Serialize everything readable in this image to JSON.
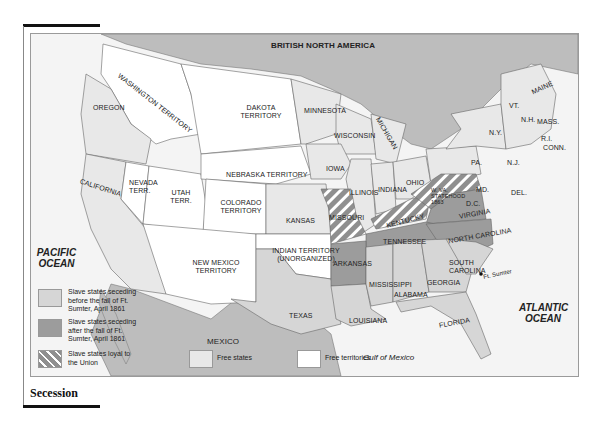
{
  "caption": "Secession",
  "map": {
    "title_region": "BRITISH NORTH AMERICA",
    "oceans": {
      "pacific": "PACIFIC OCEAN",
      "atlantic": "ATLANTIC OCEAN",
      "gulf": "Gulf of Mexico"
    },
    "labels": {
      "washington": "WASHINGTON TERRITORY",
      "oregon": "OREGON",
      "california": "CALIFORNIA",
      "nevada": "NEVADA TERR.",
      "utah": "UTAH TERR.",
      "dakota": "DAKOTA TERRITORY",
      "nebraska": "NEBRASKA TERRITORY",
      "colorado": "COLORADO TERRITORY",
      "kansas": "KANSAS",
      "newmexico": "NEW MEXICO TERRITORY",
      "indian": "INDIAN TERRITORY (UNORGANIZED)",
      "texas": "TEXAS",
      "mexico": "MEXICO",
      "minnesota": "MINNESOTA",
      "wisconsin": "WISCONSIN",
      "michigan": "MICHIGAN",
      "iowa": "IOWA",
      "illinois": "ILLINOIS",
      "indiana": "INDIANA",
      "ohio": "OHIO",
      "missouri": "MISSOURI",
      "kentucky": "KENTUCKY",
      "tennessee": "TENNESSEE",
      "arkansas": "ARKANSAS",
      "louisiana": "LOUISIANA",
      "mississippi": "MISSISSIPPI",
      "alabama": "ALABAMA",
      "georgia": "GEORGIA",
      "florida": "FLORIDA",
      "southcarolina": "SOUTH CAROLINA",
      "northcarolina": "NORTH CAROLINA",
      "virginia": "VIRGINIA",
      "wva": "W. VA. Statehood 1863",
      "dc": "D.C.",
      "md": "MD.",
      "del": "DEL.",
      "pa": "PA.",
      "nj": "N.J.",
      "ny": "N.Y.",
      "vt": "VT.",
      "nh": "N.H.",
      "maine": "MAINE",
      "mass": "MASS.",
      "ri": "R.I.",
      "conn": "CONN.",
      "ftsumter": "Ft. Sumter"
    },
    "legend": [
      {
        "key": "seceding_before",
        "text": "Slave states seceding before the fall of Ft. Sumter, April 1861",
        "color": "#d6d6d6"
      },
      {
        "key": "seceding_after",
        "text": "Slave states seceding after the fall of Ft. Sumter, April 1861",
        "color": "#9c9c9c"
      },
      {
        "key": "loyal",
        "text": "Slave states loyal to the Union",
        "color": "hatched #8f8f8f/#ffffff"
      },
      {
        "key": "free_states",
        "text": "Free states",
        "color": "#e8e8e8"
      },
      {
        "key": "free_territories",
        "text": "Free territories",
        "color": "#ffffff"
      }
    ]
  }
}
